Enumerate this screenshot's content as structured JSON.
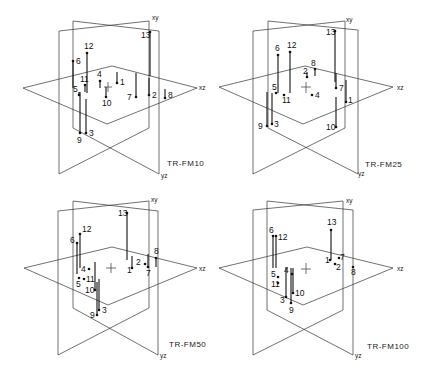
{
  "figure": {
    "axis_labels": {
      "xy": "xy",
      "xz": "xz",
      "yz": "yz"
    },
    "panels": [
      {
        "title": "TR-FM10",
        "offset": [
          0,
          0
        ],
        "points": [
          {
            "id": "1",
            "x": 117,
            "y": 83,
            "ly": 72,
            "label_dx": 3,
            "label_dy": 2
          },
          {
            "id": "2",
            "x": 149,
            "y": 95,
            "ly": 78,
            "label_dx": 3,
            "label_dy": 3
          },
          {
            "id": "3",
            "x": 86,
            "y": 133,
            "ly": 99,
            "label_dx": 3,
            "label_dy": 3
          },
          {
            "id": "4",
            "x": 100,
            "y": 81,
            "ly": 88,
            "label_dx": -3,
            "label_dy": -4
          },
          {
            "id": "5",
            "x": 79,
            "y": 95,
            "ly": 92,
            "label_dx": -6,
            "label_dy": -3
          },
          {
            "id": "6",
            "x": 73,
            "y": 61,
            "ly": 88,
            "label_dx": 3,
            "label_dy": 3
          },
          {
            "id": "7",
            "x": 136,
            "y": 97,
            "ly": 73,
            "label_dx": -9,
            "label_dy": 3
          },
          {
            "id": "8",
            "x": 165,
            "y": 98,
            "ly": 89,
            "label_dx": 3,
            "label_dy": 0
          },
          {
            "id": "9",
            "x": 80,
            "y": 133,
            "ly": 92,
            "label_dx": -3,
            "label_dy": 10
          },
          {
            "id": "10",
            "x": 106,
            "y": 97,
            "ly": 87,
            "label_dx": -4,
            "label_dy": 9
          },
          {
            "id": "11",
            "x": 85,
            "y": 85,
            "ly": 92,
            "label_dx": -5,
            "label_dy": -3
          },
          {
            "id": "12",
            "x": 87,
            "y": 53,
            "ly": 93,
            "label_dx": -3,
            "label_dy": -4
          },
          {
            "id": "13",
            "x": 150,
            "y": 32,
            "ly": 76,
            "label_dx": -9,
            "label_dy": 6
          }
        ]
      },
      {
        "title": "TR-FM25",
        "offset": [
          215,
          0
        ],
        "points": [
          {
            "id": "1",
            "x": 131,
            "y": 102,
            "ly": 80,
            "label_dx": 2,
            "label_dy": 1
          },
          {
            "id": "2",
            "x": 92,
            "y": 77,
            "ly": 72,
            "label_dx": -4,
            "label_dy": -3
          },
          {
            "id": "3",
            "x": 57,
            "y": 124,
            "ly": 93,
            "label_dx": 2,
            "label_dy": 3
          },
          {
            "id": "4",
            "x": 97,
            "y": 95,
            "ly": 95,
            "label_dx": 3,
            "label_dy": 3
          },
          {
            "id": "5",
            "x": 61,
            "y": 93,
            "ly": 93,
            "label_dx": -4,
            "label_dy": -3
          },
          {
            "id": "6",
            "x": 63,
            "y": 55,
            "ly": 93,
            "label_dx": -3,
            "label_dy": -4
          },
          {
            "id": "7",
            "x": 121,
            "y": 88,
            "ly": 73,
            "label_dx": 3,
            "label_dy": 3
          },
          {
            "id": "8",
            "x": 100,
            "y": 69,
            "ly": 76,
            "label_dx": -4,
            "label_dy": -3
          },
          {
            "id": "9",
            "x": 52,
            "y": 126,
            "ly": 92,
            "label_dx": -9,
            "label_dy": 3
          },
          {
            "id": "10",
            "x": 121,
            "y": 127,
            "ly": 97,
            "label_dx": -10,
            "label_dy": 3
          },
          {
            "id": "11",
            "x": 69,
            "y": 95,
            "ly": 95,
            "label_dx": -2,
            "label_dy": 8
          },
          {
            "id": "12",
            "x": 75,
            "y": 52,
            "ly": 93,
            "label_dx": -3,
            "label_dy": -4
          },
          {
            "id": "13",
            "x": 120,
            "y": 31,
            "ly": 82,
            "label_dx": -9,
            "label_dy": 4
          }
        ]
      },
      {
        "title": "TR-FM50",
        "offset": [
          0,
          188
        ],
        "points": [
          {
            "id": "1",
            "x": 132,
            "y": 80,
            "ly": 68,
            "label_dx": -5,
            "label_dy": 5
          },
          {
            "id": "2",
            "x": 145,
            "y": 76,
            "ly": 76,
            "label_dx": -9,
            "label_dy": 1
          },
          {
            "id": "3",
            "x": 99,
            "y": 122,
            "ly": 91,
            "label_dx": 3,
            "label_dy": 3
          },
          {
            "id": "4",
            "x": 89,
            "y": 81,
            "ly": 81,
            "label_dx": -8,
            "label_dy": 3
          },
          {
            "id": "5",
            "x": 79,
            "y": 90,
            "ly": 90,
            "label_dx": -3,
            "label_dy": 9
          },
          {
            "id": "6",
            "x": 77,
            "y": 55,
            "ly": 86,
            "label_dx": -7,
            "label_dy": 0
          },
          {
            "id": "7",
            "x": 148,
            "y": 79,
            "ly": 66,
            "label_dx": -2,
            "label_dy": 9
          },
          {
            "id": "8",
            "x": 156,
            "y": 70,
            "ly": 79,
            "label_dx": -2,
            "label_dy": -4
          },
          {
            "id": "9",
            "x": 97,
            "y": 127,
            "ly": 94,
            "label_dx": -7,
            "label_dy": 3
          },
          {
            "id": "10",
            "x": 95,
            "y": 102,
            "ly": 74,
            "label_dx": -10,
            "label_dy": 3
          },
          {
            "id": "11",
            "x": 84,
            "y": 91,
            "ly": 91,
            "label_dx": 2,
            "label_dy": 3
          },
          {
            "id": "12",
            "x": 80,
            "y": 46,
            "ly": 80,
            "label_dx": 2,
            "label_dy": -2
          },
          {
            "id": "13",
            "x": 127,
            "y": 25,
            "ly": 72,
            "label_dx": -9,
            "label_dy": 3
          }
        ]
      },
      {
        "title": "TR-FM100",
        "offset": [
          215,
          188
        ],
        "points": [
          {
            "id": "1",
            "x": 115,
            "y": 72,
            "ly": 72,
            "label_dx": -5,
            "label_dy": 3
          },
          {
            "id": "2",
            "x": 120,
            "y": 76,
            "ly": 76,
            "label_dx": 1,
            "label_dy": 6
          },
          {
            "id": "3",
            "x": 71,
            "y": 109,
            "ly": 79,
            "label_dx": -6,
            "label_dy": 6
          },
          {
            "id": "4",
            "x": 77,
            "y": 86,
            "ly": 86,
            "label_dx": -8,
            "label_dy": -1
          },
          {
            "id": "5",
            "x": 63,
            "y": 89,
            "ly": 89,
            "label_dx": -7,
            "label_dy": 0
          },
          {
            "id": "6",
            "x": 58,
            "y": 48,
            "ly": 80,
            "label_dx": -4,
            "label_dy": -3
          },
          {
            "id": "7",
            "x": 124,
            "y": 70,
            "ly": 70,
            "label_dx": 1,
            "label_dy": 2
          },
          {
            "id": "8",
            "x": 138,
            "y": 79,
            "ly": 79,
            "label_dx": -2,
            "label_dy": 8
          },
          {
            "id": "9",
            "x": 76,
            "y": 115,
            "ly": 80,
            "label_dx": -2,
            "label_dy": 10
          },
          {
            "id": "10",
            "x": 78,
            "y": 105,
            "ly": 80,
            "label_dx": 2,
            "label_dy": 3
          },
          {
            "id": "11",
            "x": 63,
            "y": 95,
            "ly": 95,
            "label_dx": -7,
            "label_dy": 4
          },
          {
            "id": "12",
            "x": 61,
            "y": 48,
            "ly": 80,
            "label_dx": 2,
            "label_dy": 4
          },
          {
            "id": "13",
            "x": 116,
            "y": 42,
            "ly": 72,
            "label_dx": -4,
            "label_dy": -5
          }
        ]
      }
    ]
  }
}
